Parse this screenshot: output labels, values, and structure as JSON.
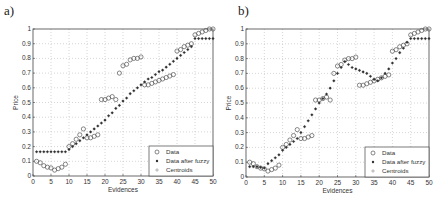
{
  "chart_data": [
    {
      "type": "scatter",
      "panel": "a)",
      "xlabel": "Evidences",
      "ylabel": "Price",
      "xlim": [
        0,
        50
      ],
      "ylim": [
        0,
        1
      ],
      "xticks": [
        0,
        5,
        10,
        15,
        20,
        25,
        30,
        35,
        40,
        45,
        50
      ],
      "yticks": [
        0,
        0.1,
        0.2,
        0.3,
        0.4,
        0.5,
        0.6,
        0.7,
        0.8,
        0.9,
        1
      ],
      "grid": true,
      "legend_position": "lower right",
      "legend": [
        "Data",
        "Data after fuzzy",
        "Centroids"
      ],
      "x": [
        1,
        2,
        3,
        4,
        5,
        6,
        7,
        8,
        9,
        10,
        11,
        12,
        13,
        14,
        15,
        16,
        17,
        18,
        19,
        20,
        21,
        22,
        23,
        24,
        25,
        26,
        27,
        28,
        29,
        30,
        31,
        32,
        33,
        34,
        35,
        36,
        37,
        38,
        39,
        40,
        41,
        42,
        43,
        44,
        45,
        46,
        47,
        48,
        49,
        50
      ],
      "series": [
        {
          "name": "Data",
          "marker": "circle-open",
          "values": [
            0.1,
            0.09,
            0.07,
            0.06,
            0.055,
            0.04,
            0.05,
            0.06,
            0.08,
            0.2,
            0.22,
            0.25,
            0.28,
            0.32,
            0.26,
            0.26,
            0.27,
            0.28,
            0.52,
            0.52,
            0.53,
            0.54,
            0.52,
            0.7,
            0.75,
            0.76,
            0.79,
            0.8,
            0.8,
            0.81,
            0.62,
            0.62,
            0.63,
            0.64,
            0.65,
            0.66,
            0.67,
            0.68,
            0.69,
            0.85,
            0.86,
            0.88,
            0.89,
            0.9,
            0.96,
            0.97,
            0.98,
            0.99,
            1.0,
            1.0
          ]
        },
        {
          "name": "Data after fuzzy",
          "marker": "star",
          "values": [
            0.165,
            0.165,
            0.165,
            0.165,
            0.165,
            0.165,
            0.165,
            0.165,
            0.165,
            0.18,
            0.2,
            0.22,
            0.24,
            0.26,
            0.28,
            0.3,
            0.32,
            0.34,
            0.36,
            0.38,
            0.41,
            0.43,
            0.46,
            0.48,
            0.51,
            0.53,
            0.56,
            0.58,
            0.6,
            0.62,
            0.64,
            0.66,
            0.67,
            0.69,
            0.71,
            0.72,
            0.74,
            0.76,
            0.78,
            0.8,
            0.82,
            0.84,
            0.86,
            0.88,
            0.935,
            0.935,
            0.935,
            0.935,
            0.935,
            0.935
          ]
        },
        {
          "name": "Centroids",
          "marker": "plus",
          "values": []
        }
      ]
    },
    {
      "type": "scatter",
      "panel": "b)",
      "xlabel": "Evidences",
      "ylabel": "Price",
      "xlim": [
        0,
        50
      ],
      "ylim": [
        0,
        1
      ],
      "xticks": [
        0,
        5,
        10,
        15,
        20,
        25,
        30,
        35,
        40,
        45,
        50
      ],
      "yticks": [
        0,
        0.1,
        0.2,
        0.3,
        0.4,
        0.5,
        0.6,
        0.7,
        0.8,
        0.9,
        1
      ],
      "grid": true,
      "legend_position": "lower right",
      "legend": [
        "Data",
        "Data after fuzzy",
        "Centroids"
      ],
      "x": [
        1,
        2,
        3,
        4,
        5,
        6,
        7,
        8,
        9,
        10,
        11,
        12,
        13,
        14,
        15,
        16,
        17,
        18,
        19,
        20,
        21,
        22,
        23,
        24,
        25,
        26,
        27,
        28,
        29,
        30,
        31,
        32,
        33,
        34,
        35,
        36,
        37,
        38,
        39,
        40,
        41,
        42,
        43,
        44,
        45,
        46,
        47,
        48,
        49,
        50
      ],
      "series": [
        {
          "name": "Data",
          "marker": "circle-open",
          "values": [
            0.1,
            0.09,
            0.07,
            0.06,
            0.055,
            0.04,
            0.05,
            0.06,
            0.08,
            0.2,
            0.22,
            0.25,
            0.28,
            0.32,
            0.26,
            0.26,
            0.27,
            0.28,
            0.52,
            0.52,
            0.53,
            0.54,
            0.52,
            0.7,
            0.75,
            0.76,
            0.79,
            0.8,
            0.8,
            0.81,
            0.62,
            0.62,
            0.63,
            0.64,
            0.65,
            0.66,
            0.67,
            0.68,
            0.69,
            0.85,
            0.86,
            0.88,
            0.89,
            0.9,
            0.96,
            0.97,
            0.98,
            0.99,
            1.0,
            1.0
          ]
        },
        {
          "name": "Data after fuzzy",
          "marker": "star",
          "values": [
            0.07,
            0.07,
            0.07,
            0.065,
            0.06,
            0.09,
            0.11,
            0.13,
            0.15,
            0.18,
            0.2,
            0.22,
            0.24,
            0.26,
            0.3,
            0.34,
            0.38,
            0.42,
            0.46,
            0.5,
            0.53,
            0.56,
            0.6,
            0.65,
            0.7,
            0.74,
            0.78,
            0.76,
            0.74,
            0.73,
            0.72,
            0.71,
            0.7,
            0.68,
            0.66,
            0.65,
            0.67,
            0.7,
            0.73,
            0.77,
            0.8,
            0.84,
            0.87,
            0.91,
            0.935,
            0.935,
            0.935,
            0.935,
            0.935,
            0.935
          ]
        },
        {
          "name": "Centroids",
          "marker": "plus",
          "values": []
        }
      ]
    }
  ],
  "panels": [
    {
      "label": "a)",
      "xlabel": "Evidences",
      "ylabel": "Price",
      "legend": {
        "data": "Data",
        "fuzzy": "Data after fuzzy",
        "centroids": "Centroids"
      }
    },
    {
      "label": "b)",
      "xlabel": "Evidences",
      "ylabel": "Price",
      "legend": {
        "data": "Data",
        "fuzzy": "Data after fuzzy",
        "centroids": "Centroids"
      }
    }
  ],
  "colors": {
    "axis": "#444444",
    "grid": "#bbbbbb",
    "data": "#555555",
    "fuzzy": "#333333",
    "centroids": "#999999"
  }
}
